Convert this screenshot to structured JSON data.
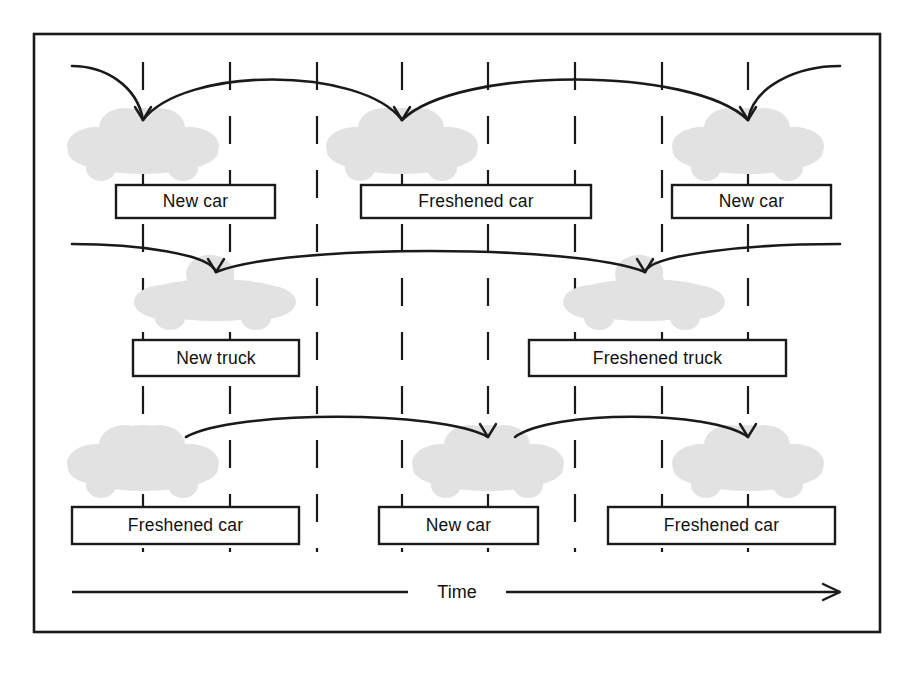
{
  "figure": {
    "type": "timeline-diagram",
    "background_color": "#ffffff",
    "ink_color": "#1a1a1a",
    "vehicle_silhouette_color": "#e2e2e2",
    "frame": {
      "x": 33,
      "y": 33,
      "width": 848,
      "height": 600
    }
  },
  "axis": {
    "label": "Time",
    "label_x": 457,
    "left_segment": {
      "x1": 72,
      "x2": 408,
      "y": 592
    },
    "right_segment": {
      "x1": 506,
      "x2": 840,
      "y": 592
    },
    "arrow_direction": "right"
  },
  "lifelines": {
    "count": 8,
    "x_positions": [
      143,
      230,
      317,
      402,
      488,
      575,
      662,
      748
    ],
    "dash_pattern": "28 26",
    "top": 62,
    "bottom": 552
  },
  "rows": [
    {
      "name": "row-cars-top",
      "vehicle_type": "car",
      "vehicle_y": 148,
      "boxes": [
        {
          "label": "New car",
          "x": 116,
          "y": 185,
          "width": 159,
          "height": 33
        },
        {
          "label": "Freshened car",
          "x": 361,
          "y": 185,
          "width": 230,
          "height": 33
        },
        {
          "label": "New car",
          "x": 672,
          "y": 185,
          "width": 159,
          "height": 33
        }
      ],
      "vehicles": [
        {
          "cx": 143,
          "cy": 148
        },
        {
          "cx": 402,
          "cy": 148
        },
        {
          "cx": 748,
          "cy": 148
        }
      ],
      "arcs": [
        {
          "from_x": 72,
          "to_x": 143,
          "peak_y": 66,
          "kind": "incoming-left"
        },
        {
          "from_x": 143,
          "to_x": 402,
          "peak_y": 66,
          "kind": "span"
        },
        {
          "from_x": 402,
          "to_x": 748,
          "peak_y": 66,
          "kind": "span"
        },
        {
          "from_x": 748,
          "to_x": 840,
          "peak_y": 66,
          "kind": "outgoing-right"
        }
      ]
    },
    {
      "name": "row-trucks-middle",
      "vehicle_type": "truck",
      "vehicle_y": 300,
      "boxes": [
        {
          "label": "New truck",
          "x": 133,
          "y": 340,
          "width": 166,
          "height": 36
        },
        {
          "label": "Freshened truck",
          "x": 529,
          "y": 340,
          "width": 257,
          "height": 36
        }
      ],
      "vehicles": [
        {
          "cx": 216,
          "cy": 300
        },
        {
          "cx": 645,
          "cy": 300
        }
      ],
      "arcs": [
        {
          "from_x": 72,
          "to_x": 216,
          "peak_y": 244,
          "kind": "incoming-left"
        },
        {
          "from_x": 216,
          "to_x": 645,
          "peak_y": 244,
          "kind": "span"
        },
        {
          "from_x": 645,
          "to_x": 840,
          "peak_y": 244,
          "kind": "outgoing-right"
        }
      ]
    },
    {
      "name": "row-cars-bottom",
      "vehicle_type": "car",
      "vehicle_y": 465,
      "boxes": [
        {
          "label": "Freshened car",
          "x": 72,
          "y": 507,
          "width": 227,
          "height": 37
        },
        {
          "label": "New car",
          "x": 379,
          "y": 507,
          "width": 159,
          "height": 37
        },
        {
          "label": "Freshened car",
          "x": 608,
          "y": 507,
          "width": 227,
          "height": 37
        }
      ],
      "vehicles": [
        {
          "cx": 143,
          "cy": 465
        },
        {
          "cx": 488,
          "cy": 465
        },
        {
          "cx": 748,
          "cy": 465
        }
      ],
      "arcs": [
        {
          "from_x": 186,
          "to_x": 488,
          "peak_y": 410,
          "kind": "span"
        },
        {
          "from_x": 515,
          "to_x": 748,
          "peak_y": 410,
          "kind": "span"
        }
      ]
    }
  ],
  "labels": {
    "new_car": "New car",
    "freshened_car": "Freshened car",
    "new_truck": "New truck",
    "freshened_truck": "Freshened truck",
    "time": "Time"
  }
}
